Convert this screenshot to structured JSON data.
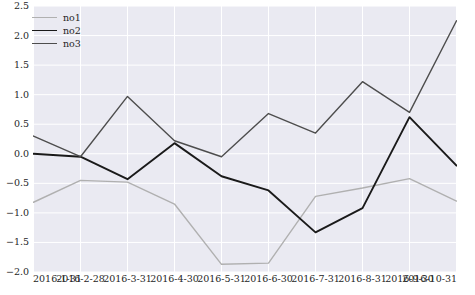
{
  "chart_data": {
    "type": "line",
    "title": "",
    "xlabel": "",
    "ylabel": "",
    "grid": true,
    "legend_position": "upper-left",
    "categories": [
      "2016-1-31",
      "2016-2-28",
      "2016-3-31",
      "2016-4-30",
      "2016-5-31",
      "2016-6-30",
      "2016-7-31",
      "2016-8-31",
      "2016-9-30",
      "2016-10-31"
    ],
    "x_tick_labels": [
      "2016-1-31",
      "2016-2-28",
      "2016-3-31",
      "2016-4-30",
      "2016-5-31",
      "2016-6-30",
      "2016-7-31",
      "2016-8-31",
      "2016-9-30",
      "2016-10-31"
    ],
    "y_tick_labels": [
      "2.5",
      "2.0",
      "1.5",
      "1.0",
      "0.5",
      "0.0",
      "-0.5",
      "-1.0",
      "-1.5",
      "-2.0"
    ],
    "y_ticks": [
      2.5,
      2.0,
      1.5,
      1.0,
      0.5,
      0.0,
      -0.5,
      -1.0,
      -1.5,
      -2.0
    ],
    "ylim": [
      -2.0,
      2.5
    ],
    "xlim": [
      0,
      9
    ],
    "series": [
      {
        "name": "no1",
        "color": "#b0b0b0",
        "linewidth": 1.4,
        "values": [
          -0.82,
          -0.45,
          -0.48,
          -0.85,
          -1.87,
          -1.85,
          -0.72,
          -0.58,
          -0.42,
          -0.8
        ]
      },
      {
        "name": "no2",
        "color": "#1a1a1a",
        "linewidth": 1.9,
        "values": [
          0.0,
          -0.05,
          -0.43,
          0.18,
          -0.38,
          -0.62,
          -1.33,
          -0.92,
          0.62,
          -0.2
        ]
      },
      {
        "name": "no3",
        "color": "#4d4d4d",
        "linewidth": 1.4,
        "values": [
          0.3,
          -0.05,
          0.97,
          0.22,
          -0.05,
          0.68,
          0.35,
          1.22,
          0.7,
          2.25
        ]
      }
    ]
  },
  "legend": {
    "items": [
      {
        "label": "no1",
        "color": "#b0b0b0",
        "linewidth": 1.4
      },
      {
        "label": "no2",
        "color": "#1a1a1a",
        "linewidth": 1.9
      },
      {
        "label": "no3",
        "color": "#4d4d4d",
        "linewidth": 1.4
      }
    ]
  },
  "style": {
    "plot_background": "#eaeaf2",
    "figure_background": "#ffffff",
    "grid_color": "#ffffff",
    "tick_label_color": "#262626"
  }
}
